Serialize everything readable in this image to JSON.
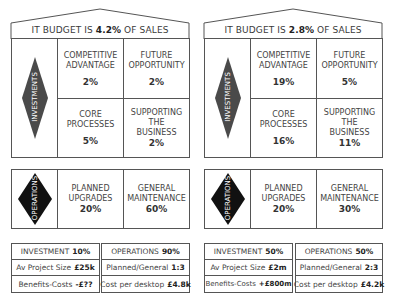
{
  "houses": [
    {
      "title_prefix": "IT BUDGET IS",
      "budget_pct": "4.2%",
      "title_suffix": "OF SALES",
      "investments": {
        "label": "INVESTMENTS",
        "cells": [
          {
            "label_lines": [
              "COMPETITIVE",
              "ADVANTAGE"
            ],
            "value": "2%"
          },
          {
            "label_lines": [
              "FUTURE",
              "OPPORTUNITY"
            ],
            "value": "2%"
          },
          {
            "label_lines": [
              "CORE",
              "PROCESSES"
            ],
            "value": "5%"
          },
          {
            "label_lines": [
              "SUPPORTING",
              "THE",
              "BUSINESS"
            ],
            "value": "2%"
          }
        ]
      },
      "operations": {
        "label": "OPERATIONS",
        "cells": [
          {
            "label_lines": [
              "PLANNED",
              "UPGRADES"
            ],
            "value": "20%"
          },
          {
            "label_lines": [
              "GENERAL",
              "MAINTENANCE"
            ],
            "value": "60%"
          }
        ]
      },
      "summary_left": [
        {
          "label": "INVESTMENT",
          "value": "10%"
        },
        {
          "label": "Av Project Size",
          "value": "£25k"
        },
        {
          "label": "Benefits-Costs",
          "value": "-£??"
        }
      ],
      "summary_right": [
        {
          "label": "OPERATIONS",
          "value": "90%"
        },
        {
          "label": "Planned/General",
          "value": "1:3"
        },
        {
          "label": "Cost per desktop",
          "value": "£4.8k"
        }
      ]
    },
    {
      "title_prefix": "IT BUDGET IS",
      "budget_pct": "2.8%",
      "title_suffix": "OF SALES",
      "investments": {
        "label": "INVESTMENTS",
        "cells": [
          {
            "label_lines": [
              "COMPETITIVE",
              "ADVANTAGE"
            ],
            "value": "19%"
          },
          {
            "label_lines": [
              "FUTURE",
              "OPPORTUNITY"
            ],
            "value": "5%"
          },
          {
            "label_lines": [
              "CORE",
              "PROCESSES"
            ],
            "value": "16%"
          },
          {
            "label_lines": [
              "SUPPORTING",
              "THE",
              "BUSINESS"
            ],
            "value": "11%"
          }
        ]
      },
      "operations": {
        "label": "OPERATIONS",
        "cells": [
          {
            "label_lines": [
              "PLANNED",
              "UPGRADES"
            ],
            "value": "20%"
          },
          {
            "label_lines": [
              "GENERAL",
              "MAINTENANCE"
            ],
            "value": "30%"
          }
        ]
      },
      "summary_left": [
        {
          "label": "INVESTMENT",
          "value": "50%"
        },
        {
          "label": "Av Project Size",
          "value": "£2m"
        },
        {
          "label": "Benefits-Costs",
          "value": "+£800m"
        }
      ],
      "summary_right": [
        {
          "label": "OPERATIONS",
          "value": "50%"
        },
        {
          "label": "Planned/General",
          "value": "2:3"
        },
        {
          "label": "Cost per desktop",
          "value": "£4.2k"
        }
      ]
    }
  ],
  "colors": {
    "investments_diamond": "#4a4a4a",
    "operations_diamond": "#111111",
    "line": "#555555"
  }
}
